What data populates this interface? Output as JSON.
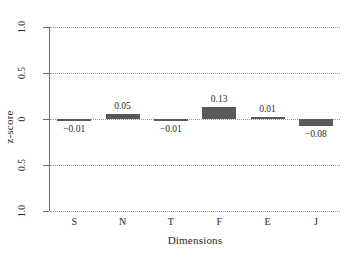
{
  "chart_data": {
    "type": "bar",
    "title": "",
    "subtitle": "",
    "xlabel": "Dimensions",
    "ylabel": "z-score",
    "categories": [
      "S",
      "N",
      "T",
      "F",
      "E",
      "J"
    ],
    "values": [
      -0.01,
      0.05,
      -0.01,
      0.13,
      0.01,
      -0.08
    ],
    "value_labels": [
      "−0.01",
      "0.05",
      "−0.01",
      "0.13",
      "0.01",
      "−0.08"
    ],
    "series": [
      {
        "name": "z-score",
        "values": [
          -0.01,
          0.05,
          -0.01,
          0.13,
          0.01,
          -0.08
        ]
      }
    ],
    "ylim": [
      -1.0,
      1.0
    ],
    "yticks": [
      1.0,
      0.5,
      0,
      -0.5,
      -1.0
    ],
    "ytick_labels": [
      "1.0",
      "0.5",
      "0",
      "0.5",
      "1.0"
    ],
    "grid": "horizontal-dotted",
    "legend": "none",
    "bar_color": "#595959",
    "grid_color": "#9a9a9a",
    "axis_color": "#6e6e6e",
    "background": "#ffffff"
  }
}
